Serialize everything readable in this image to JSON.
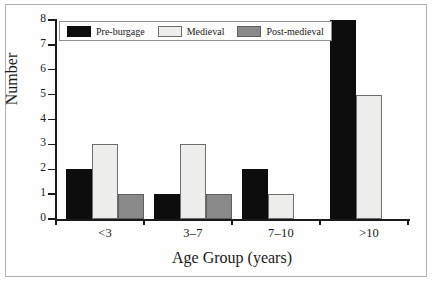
{
  "chart_data": {
    "type": "bar",
    "title": "",
    "subtitle": "",
    "xlabel": "Age Group (years)",
    "ylabel": "Number",
    "categories": [
      "<3",
      "3–7",
      "7–10",
      ">10"
    ],
    "series": [
      {
        "name": "Pre-burgage",
        "values": [
          2,
          1,
          2,
          8
        ],
        "color": "#0d0d0d"
      },
      {
        "name": "Medieval",
        "values": [
          3,
          3,
          1,
          5
        ],
        "color": "#ededec"
      },
      {
        "name": "Post-medieval",
        "values": [
          1,
          1,
          0,
          0
        ],
        "color": "#8a8a8a"
      }
    ],
    "ylim": [
      0,
      8
    ],
    "yticks": [
      0,
      1,
      2,
      3,
      4,
      5,
      6,
      7,
      8
    ],
    "ytick_labels": [
      "0",
      "1",
      "2",
      "3",
      "4",
      "5",
      "6",
      "7",
      "8"
    ],
    "grid": false,
    "legend_position": "top-left",
    "legend_entries": [
      "Pre-burgage",
      "Medieval",
      "Post-medieval"
    ]
  }
}
